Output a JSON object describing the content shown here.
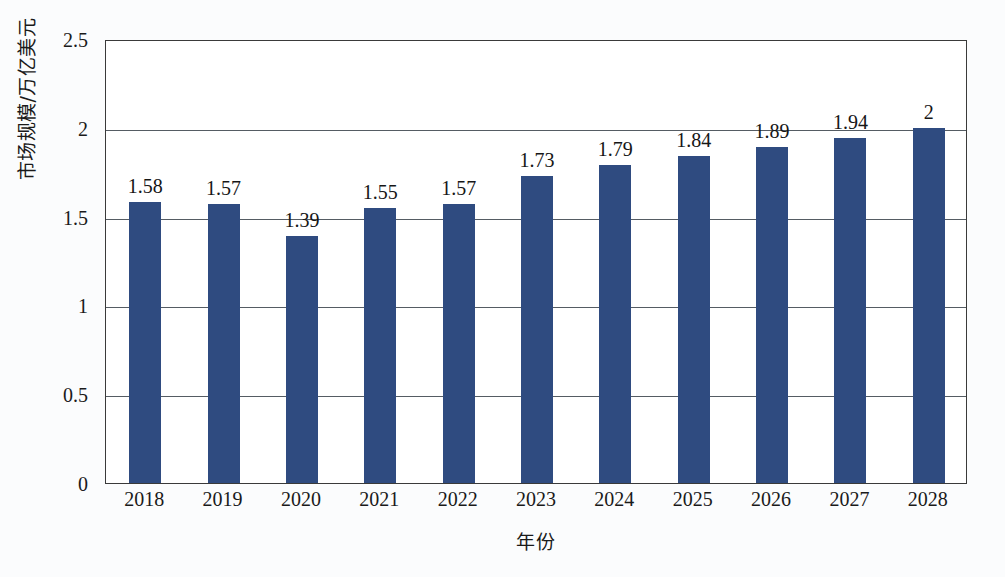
{
  "chart_data": {
    "type": "bar",
    "title": "",
    "xlabel": "年份",
    "ylabel": "市场规模/万亿美元",
    "categories": [
      "2018",
      "2019",
      "2020",
      "2021",
      "2022",
      "2023",
      "2024",
      "2025",
      "2026",
      "2027",
      "2028"
    ],
    "values": [
      1.58,
      1.57,
      1.39,
      1.55,
      1.57,
      1.73,
      1.79,
      1.84,
      1.89,
      1.94,
      2
    ],
    "value_labels": [
      "1.58",
      "1.57",
      "1.39",
      "1.55",
      "1.57",
      "1.73",
      "1.79",
      "1.84",
      "1.89",
      "1.94",
      "2"
    ],
    "series": [
      {
        "name": "市场规模",
        "values": [
          1.58,
          1.57,
          1.39,
          1.55,
          1.57,
          1.73,
          1.79,
          1.84,
          1.89,
          1.94,
          2
        ]
      }
    ],
    "ylim": [
      0,
      2.5
    ],
    "yticks": [
      0,
      0.5,
      1,
      1.5,
      2,
      2.5
    ],
    "ytick_labels": [
      "0",
      "0.5",
      "1",
      "1.5",
      "2",
      "2.5"
    ],
    "grid": "horizontal",
    "legend": "none",
    "bar_color": "#2f4b80",
    "axis_color": "#3a3a3a",
    "gridline_color": "#555c63",
    "plot_background": "#ffffff",
    "figure_background": "#fbfcfd"
  }
}
